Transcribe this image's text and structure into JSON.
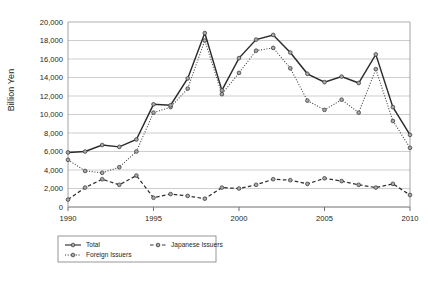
{
  "chart_data": {
    "type": "line",
    "title": "",
    "xlabel": "",
    "ylabel": "Billion Yen",
    "ylim": [
      0,
      20000
    ],
    "xlim": [
      1990,
      2010
    ],
    "ytick_step": 2000,
    "grid": true,
    "legend_position": "bottom-left",
    "yticks": [
      "0",
      "2,000",
      "4,000",
      "6,000",
      "8,000",
      "10,000",
      "12,000",
      "14,000",
      "16,000",
      "18,000",
      "20,000"
    ],
    "xticks": [
      "1990",
      "1995",
      "2000",
      "2005",
      "2010"
    ],
    "x": [
      1990,
      1991,
      1992,
      1993,
      1994,
      1995,
      1996,
      1997,
      1998,
      1999,
      2000,
      2001,
      2002,
      2003,
      2004,
      2005,
      2006,
      2007,
      2008,
      2009,
      2010
    ],
    "series": [
      {
        "name": "Total",
        "style": "solid",
        "values": [
          5900,
          6000,
          6700,
          6500,
          7300,
          11100,
          11000,
          13900,
          18800,
          12600,
          16100,
          18100,
          18600,
          16700,
          14400,
          13500,
          14100,
          13400,
          16500,
          10800,
          7800
        ]
      },
      {
        "name": "Foreign Issuers",
        "style": "dotted",
        "values": [
          5100,
          3900,
          3700,
          4300,
          6000,
          10200,
          10800,
          12800,
          18000,
          12200,
          14500,
          16900,
          17200,
          15000,
          11500,
          10500,
          11600,
          10200,
          14900,
          9300,
          6400
        ]
      },
      {
        "name": "Japanese Issuers",
        "style": "dashed",
        "values": [
          800,
          2100,
          3000,
          2400,
          3400,
          1000,
          1400,
          1200,
          900,
          2100,
          2000,
          2400,
          3000,
          2900,
          2500,
          3100,
          2800,
          2400,
          2100,
          2500,
          1300
        ]
      }
    ]
  },
  "legend": {
    "entries": [
      {
        "label": "Total",
        "marker": "solid-line-marker"
      },
      {
        "label": "Japanese Issuers",
        "marker": "dashed-line-marker"
      },
      {
        "label": "Foreign Issuers",
        "marker": "dotted-line-marker"
      }
    ]
  }
}
